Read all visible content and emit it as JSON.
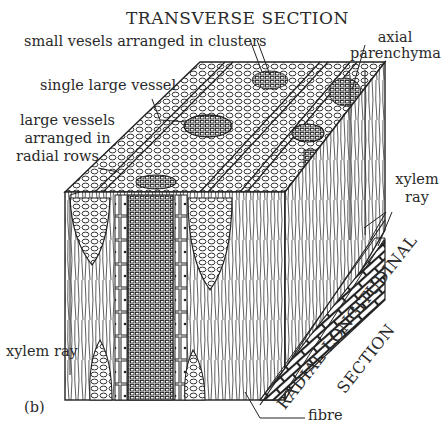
{
  "figure": {
    "panel_label": "(b)",
    "title": "TRANSVERSE SECTION",
    "side_title_line1": "RADIAL LONGITUDINAL",
    "side_title_line2": "SECTION",
    "labels": {
      "small_vessels": "small vesels arranged in clusters",
      "axial_parenchyma_1": "axial",
      "axial_parenchyma_2": "parenchyma",
      "single_large_vessel": "single large vessel",
      "large_vessels_1": "large vessels",
      "large_vessels_2": "arranged in",
      "large_vessels_3": "radial rows",
      "xylem_ray_right_1": "xylem",
      "xylem_ray_right_2": "ray",
      "xylem_ray_left": "xylem ray",
      "fibre": "fibre"
    },
    "colors": {
      "ink": "#2a2a2a",
      "background": "#ffffff"
    }
  }
}
